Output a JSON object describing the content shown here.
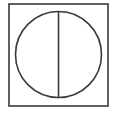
{
  "diagram": {
    "stroke_color": "#3a3a3a",
    "background_color": "#ffffff",
    "stroke_width": 1.6,
    "square": {
      "x": 9,
      "y": 4,
      "width": 99,
      "height": 102
    },
    "circle": {
      "cx": 58.5,
      "cy": 54.5,
      "r": 43
    },
    "vertical_line": {
      "x1": 58.5,
      "y1": 11.5,
      "x2": 58.5,
      "y2": 97.5
    }
  }
}
